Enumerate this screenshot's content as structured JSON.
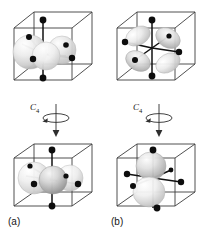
{
  "figure": {
    "background_color": "#ffffff",
    "line_color": "#3a3a3a",
    "ligand_color": "#0d0d0d",
    "lobe_light": "#f2f2f2",
    "lobe_mid": "#c9c9c9",
    "lobe_dark": "#8f8f8f",
    "center_sphere_dark": "#9a9a9a"
  },
  "panels": [
    {
      "id": "top-left",
      "position": "top-left",
      "orbital": "two-lobe-horizontal-spheres",
      "description": "cube with large light spheres in horizontal plane and black ligand dots on axes",
      "ligand_count": 6
    },
    {
      "id": "top-right",
      "position": "top-right",
      "orbital": "four-lobe-clover",
      "description": "cube with four-lobed clover orbital and black ligand dots on axes",
      "ligand_count": 6
    },
    {
      "id": "bottom-left",
      "position": "bottom-left",
      "orbital": "two-lobe-horizontal-spheres-rotated",
      "description": "cube with spheres after C4 rotation, dark central sphere",
      "ligand_count": 6,
      "label": "(a)"
    },
    {
      "id": "bottom-right",
      "position": "bottom-right",
      "orbital": "two-lobe-vertical",
      "description": "cube with vertical two-lobe dz2-like orbital after C4 rotation",
      "ligand_count": 6,
      "label": "(b)"
    }
  ],
  "operations": [
    {
      "id": "rotation-left",
      "symbol": "C",
      "subscript": "4",
      "axis": "vertical",
      "direction": "downward-arrow-with-curved-rotation"
    },
    {
      "id": "rotation-right",
      "symbol": "C",
      "subscript": "4",
      "axis": "vertical",
      "direction": "downward-arrow-with-curved-rotation"
    }
  ],
  "labels": {
    "panel_a": "(a)",
    "panel_b": "(b)"
  }
}
